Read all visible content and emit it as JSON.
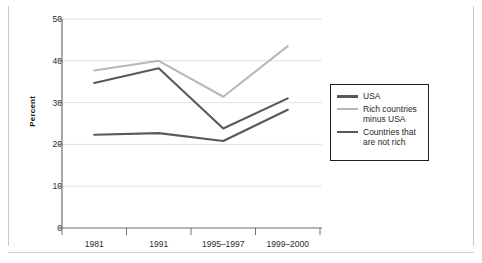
{
  "chart_data": {
    "type": "line",
    "title": "",
    "xlabel": "",
    "ylabel": "Percent",
    "categories": [
      "1981",
      "1991",
      "1995–1997",
      "1999–2000"
    ],
    "ylim": [
      0,
      50
    ],
    "yticks": [
      0,
      10,
      20,
      30,
      40,
      50
    ],
    "ytick_labels": [
      "0",
      "10",
      "20",
      "30",
      "40",
      "50"
    ],
    "grid": true,
    "grid_axis": "y",
    "legend_position": "right",
    "series": [
      {
        "name": "USA",
        "color": "#595959",
        "values": [
          34.7,
          38.2,
          23.8,
          31.0
        ]
      },
      {
        "name": "Rich countries minus USA",
        "color": "#b8b8b8",
        "values": [
          37.7,
          40.0,
          31.4,
          43.5
        ]
      },
      {
        "name": "Countries that are not rich",
        "color": "#595959",
        "values": [
          22.3,
          22.7,
          20.8,
          28.3
        ]
      }
    ]
  },
  "axis": {
    "y_title": "Percent"
  },
  "legend": {
    "items": [
      {
        "label": "USA",
        "color": "#595959"
      },
      {
        "label": "Rich countries\nminus USA",
        "color": "#b8b8b8"
      },
      {
        "label": "Countries that\nare not rich",
        "color": "#595959"
      }
    ]
  },
  "style": {
    "background": "#ffffff",
    "axis_color": "#6e6e6e",
    "grid_color": "#e2e2e2",
    "text_color": "#2b2b2b",
    "frame_color": "#c9c9c9"
  }
}
